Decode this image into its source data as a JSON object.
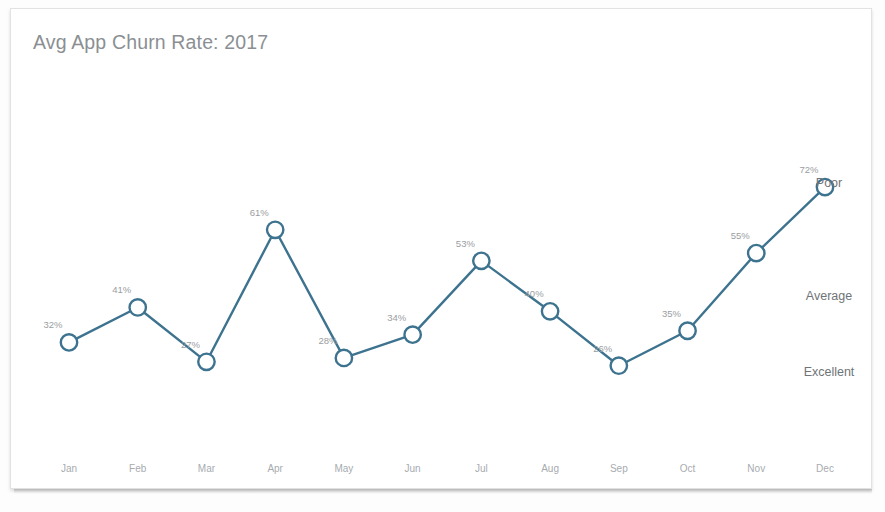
{
  "card": {
    "title": "Avg App Churn Rate: 2017",
    "background_color": "#ffffff",
    "border_color": "#e2e2e2"
  },
  "chart_data": {
    "type": "line",
    "title": "Avg App Churn Rate: 2017",
    "xlabel": "",
    "ylabel": "",
    "grid": false,
    "legend": "none",
    "ylim": [
      20,
      80
    ],
    "value_suffix": "%",
    "accent_color": "#3d738f",
    "label_color": "#9a9ea2",
    "axis_label_color": "#a7abaf",
    "title_color": "#8b8f93",
    "categories": [
      "Jan",
      "Feb",
      "Mar",
      "Apr",
      "May",
      "Jun",
      "Jul",
      "Aug",
      "Sep",
      "Oct",
      "Nov",
      "Dec"
    ],
    "values": [
      32,
      41,
      27,
      61,
      28,
      34,
      53,
      40,
      26,
      35,
      55,
      72
    ],
    "point_labels": [
      "32%",
      "41%",
      "27%",
      "61%",
      "28%",
      "34%",
      "53%",
      "40%",
      "26%",
      "35%",
      "55%",
      "72%"
    ],
    "annotations": [
      {
        "text": "Poor",
        "value": 73,
        "position": "right"
      },
      {
        "text": "Average",
        "value": 44,
        "position": "right"
      },
      {
        "text": "Excellent",
        "value": 24.5,
        "position": "right"
      }
    ]
  }
}
